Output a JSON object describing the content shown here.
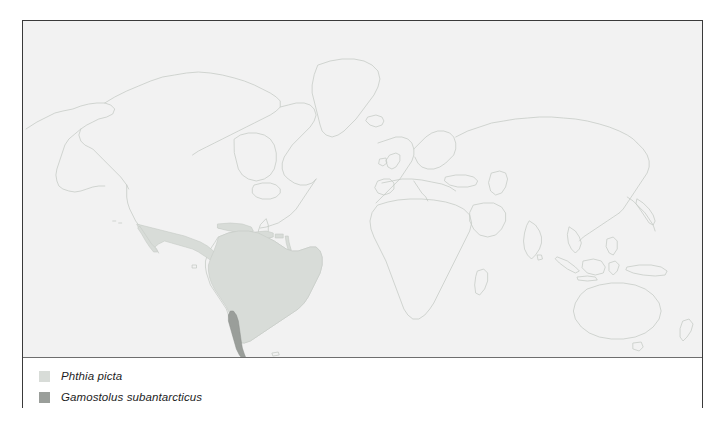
{
  "figure": {
    "type": "species-distribution-map",
    "projection": "equirectangular world map",
    "map_background_color": "#f2f2f2",
    "page_background_color": "#ffffff",
    "frame_border_color": "#3a3a3a",
    "coastline_color": "#c4c9c4",
    "divider_color": "#6e6e6e"
  },
  "legend": {
    "items": [
      {
        "label": "Phthia picta",
        "color": "#d8dcd8",
        "swatch_name": "legend-swatch-phthia-picta",
        "regions": "Mexico, Central America, Caribbean, most of South America"
      },
      {
        "label": "Gamostolus subantarcticus",
        "color": "#9a9e9a",
        "swatch_name": "legend-swatch-gamostolus-subantarcticus",
        "regions": "southern Chile / Patagonia"
      }
    ]
  },
  "map_regions": {
    "light_shade_color": "#d8dcd8",
    "dark_shade_color": "#9a9e9a",
    "outline_color": "#c4c9c4"
  }
}
